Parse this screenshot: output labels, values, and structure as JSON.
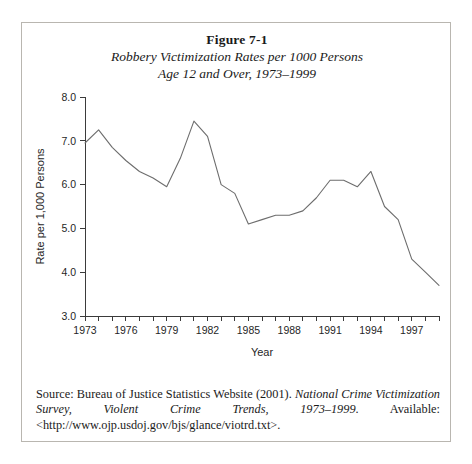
{
  "figure": {
    "number_label": "Figure 7-1",
    "subtitle_line1": "Robbery Victimization Rates per 1000 Persons",
    "subtitle_line2": "Age 12 and Over, 1973–1999"
  },
  "source": {
    "prefix": "Source: Bureau of Justice Statistics Website (2001). ",
    "italic_title": "National Crime Victimization Survey, Violent Crime Trends, 1973–1999",
    "suffix": ". Available: <http://www.ojp.usdoj.gov/bjs/glance/viotrd.txt>."
  },
  "chart_data": {
    "type": "line",
    "title": "Robbery Victimization Rates per 1000 Persons Age 12 and Over, 1973–1999",
    "xlabel": "Year",
    "ylabel": "Rate per 1,000 Persons",
    "xlim": [
      1973,
      1999
    ],
    "ylim": [
      3.0,
      8.0
    ],
    "grid": false,
    "legend": false,
    "ytick_values": [
      3.0,
      4.0,
      5.0,
      6.0,
      7.0,
      8.0
    ],
    "ytick_labels": [
      "3.0",
      "4.0",
      "5.0",
      "6.0",
      "7.0",
      "8.0"
    ],
    "xtick_values": [
      1973,
      1974,
      1975,
      1976,
      1977,
      1978,
      1979,
      1980,
      1981,
      1982,
      1983,
      1984,
      1985,
      1986,
      1987,
      1988,
      1989,
      1990,
      1991,
      1992,
      1993,
      1994,
      1995,
      1996,
      1997,
      1998,
      1999
    ],
    "xtick_labeled": [
      1973,
      1976,
      1979,
      1982,
      1985,
      1988,
      1991,
      1994,
      1997
    ],
    "xtick_labels": [
      "1973",
      "1976",
      "1979",
      "1982",
      "1985",
      "1988",
      "1991",
      "1994",
      "1997"
    ],
    "x": [
      1973,
      1974,
      1975,
      1976,
      1977,
      1978,
      1979,
      1980,
      1981,
      1982,
      1983,
      1984,
      1985,
      1986,
      1987,
      1988,
      1989,
      1990,
      1991,
      1992,
      1993,
      1994,
      1995,
      1996,
      1997,
      1998,
      1999
    ],
    "values": [
      6.95,
      7.25,
      6.85,
      6.55,
      6.3,
      6.15,
      5.95,
      6.6,
      7.45,
      7.1,
      6.0,
      5.8,
      5.1,
      5.2,
      5.3,
      5.3,
      5.4,
      5.7,
      6.1,
      6.1,
      5.95,
      6.3,
      5.5,
      5.2,
      4.3,
      4.0,
      3.7
    ],
    "series": [
      {
        "name": "Robbery victimization rate",
        "color": "#6d6d6d",
        "values": [
          6.95,
          7.25,
          6.85,
          6.55,
          6.3,
          6.15,
          5.95,
          6.6,
          7.45,
          7.1,
          6.0,
          5.8,
          5.1,
          5.2,
          5.3,
          5.3,
          5.4,
          5.7,
          6.1,
          6.1,
          5.95,
          6.3,
          5.5,
          5.2,
          4.3,
          4.0,
          3.7
        ]
      }
    ]
  }
}
